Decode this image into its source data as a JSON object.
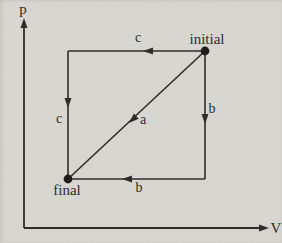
{
  "figure": {
    "background_color": "#d9d8d3",
    "ink_color": "#2f2d2a",
    "axes": {
      "y_label": "p",
      "x_label": "V"
    },
    "states": {
      "initial_label": "initial",
      "final_label": "final"
    },
    "process_labels": {
      "a": "a",
      "b_right": "b",
      "b_bottom": "b",
      "c_top": "c",
      "c_left": "c"
    }
  }
}
